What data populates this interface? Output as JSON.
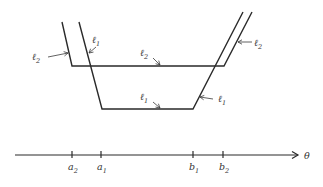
{
  "figure": {
    "curves": [
      {
        "id": "l2",
        "name": "ℓ",
        "subscript": "2",
        "points": [
          [
            62,
            22
          ],
          [
            72,
            66
          ],
          [
            224,
            66
          ],
          [
            252,
            12
          ]
        ]
      },
      {
        "id": "l1",
        "name": "ℓ",
        "subscript": "1",
        "points": [
          [
            79,
            22
          ],
          [
            102,
            109
          ],
          [
            193,
            109
          ],
          [
            243,
            12
          ]
        ]
      }
    ],
    "annotations": [
      {
        "curve": "l2",
        "base": "ℓ",
        "sub": "2",
        "text_x": 32,
        "text_y": 60,
        "arrow": [
          [
            48,
            57
          ],
          [
            68,
            53
          ]
        ]
      },
      {
        "curve": "l1",
        "base": "ℓ",
        "sub": "1",
        "text_x": 92,
        "text_y": 43,
        "arrow": [
          [
            96,
            47
          ],
          [
            89,
            53
          ]
        ]
      },
      {
        "curve": "l2",
        "base": "ℓ",
        "sub": "2",
        "text_x": 140,
        "text_y": 56,
        "arrow": [
          [
            153,
            58
          ],
          [
            160,
            65
          ]
        ]
      },
      {
        "curve": "l1",
        "base": "ℓ",
        "sub": "1",
        "text_x": 140,
        "text_y": 100,
        "arrow": [
          [
            153,
            102
          ],
          [
            160,
            108
          ]
        ]
      },
      {
        "curve": "l2",
        "base": "ℓ",
        "sub": "2",
        "text_x": 254,
        "text_y": 46,
        "arrow": [
          [
            252,
            42
          ],
          [
            238,
            42
          ]
        ]
      },
      {
        "curve": "l1",
        "base": "ℓ",
        "sub": "1",
        "text_x": 218,
        "text_y": 102,
        "arrow": [
          [
            213,
            99
          ],
          [
            200,
            97
          ]
        ]
      }
    ],
    "axis": {
      "label": "θ",
      "y": 155,
      "x_start": 15,
      "x_end": 298,
      "ticks": [
        {
          "base": "a",
          "sub": "2",
          "x": 72
        },
        {
          "base": "a",
          "sub": "1",
          "x": 101
        },
        {
          "base": "b",
          "sub": "1",
          "x": 193
        },
        {
          "base": "b",
          "sub": "2",
          "x": 223
        }
      ]
    }
  }
}
